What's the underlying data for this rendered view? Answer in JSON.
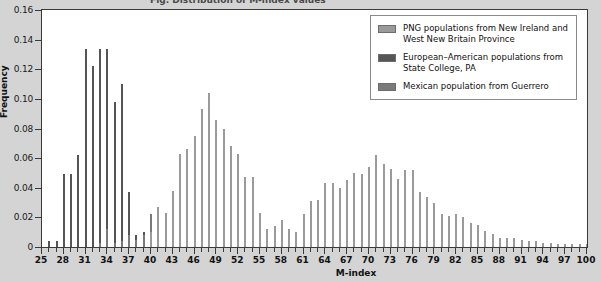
{
  "figure": {
    "cropped_title": "Fig. Distribution of M-index values"
  },
  "axes": {
    "y_title": "Frequency",
    "x_title": "M-index",
    "y_ticks": [
      "0",
      "0.02",
      "0.04",
      "0.06",
      "0.08",
      "0.10",
      "0.12",
      "0.14",
      "0.16"
    ],
    "x_ticks": [
      "25",
      "28",
      "31",
      "34",
      "37",
      "40",
      "43",
      "46",
      "49",
      "52",
      "55",
      "58",
      "61",
      "64",
      "67",
      "70",
      "73",
      "76",
      "79",
      "82",
      "85",
      "88",
      "91",
      "94",
      "97",
      "100"
    ]
  },
  "legend": {
    "items": [
      {
        "label": "PNG populations from New Ireland and West New Britain Province",
        "color": "#9a9a9a",
        "key": "png"
      },
      {
        "label": "European–American populations from State College, PA",
        "color": "#555555",
        "key": "eur"
      },
      {
        "label": "Mexican population from Guerrero",
        "color": "#7a7a7a",
        "key": "mex"
      }
    ]
  },
  "chart_data": {
    "type": "bar",
    "title": "",
    "xlabel": "M-index",
    "ylabel": "Frequency",
    "xlim": [
      25,
      100
    ],
    "ylim": [
      0,
      0.16
    ],
    "grid": false,
    "legend_position": "top-right",
    "x": [
      25,
      26,
      27,
      28,
      29,
      30,
      31,
      32,
      33,
      34,
      35,
      36,
      37,
      38,
      39,
      40,
      41,
      42,
      43,
      44,
      45,
      46,
      47,
      48,
      49,
      50,
      51,
      52,
      53,
      54,
      55,
      56,
      57,
      58,
      59,
      60,
      61,
      62,
      63,
      64,
      65,
      66,
      67,
      68,
      69,
      70,
      71,
      72,
      73,
      74,
      75,
      76,
      77,
      78,
      79,
      80,
      81,
      82,
      83,
      84,
      85,
      86,
      87,
      88,
      89,
      90,
      91,
      92,
      93,
      94,
      95,
      96,
      97,
      98,
      99,
      100
    ],
    "series": [
      {
        "name": "European–American populations from State College, PA",
        "color": "#555555",
        "values": [
          0,
          0.004,
          0.004,
          0.049,
          0.049,
          0.062,
          0.134,
          0.122,
          0.134,
          0.134,
          0.098,
          0.11,
          0.037,
          0.008,
          0.01,
          0.018,
          0.004,
          0.01,
          0.006,
          0.004,
          0.004,
          0.002,
          0.002,
          0.002,
          0.002,
          0.002,
          0.001,
          0.001,
          0.001,
          0.001,
          0.001,
          0,
          0,
          0,
          0,
          0,
          0,
          0,
          0,
          0,
          0,
          0,
          0,
          0,
          0,
          0,
          0,
          0,
          0,
          0,
          0,
          0,
          0,
          0,
          0,
          0,
          0,
          0,
          0,
          0,
          0,
          0,
          0,
          0,
          0,
          0,
          0,
          0,
          0,
          0,
          0,
          0,
          0,
          0,
          0,
          0
        ]
      },
      {
        "name": "Mexican population from Guerrero",
        "color": "#7a7a7a",
        "values": [
          0,
          0,
          0,
          0,
          0,
          0,
          0,
          0,
          0.003,
          0.012,
          0.003,
          0.004,
          0.008,
          0.005,
          0.008,
          0.022,
          0.006,
          0.008,
          0.025,
          0.006,
          0.006,
          0.006,
          0.005,
          0.006,
          0.006,
          0.006,
          0.005,
          0.005,
          0.005,
          0.004,
          0.004,
          0.004,
          0.004,
          0.004,
          0.004,
          0.004,
          0.004,
          0.004,
          0.004,
          0.004,
          0.004,
          0.004,
          0.004,
          0.004,
          0.004,
          0.004,
          0.004,
          0.004,
          0.004,
          0.003,
          0.003,
          0.003,
          0.003,
          0.003,
          0.003,
          0.003,
          0.003,
          0.003,
          0.002,
          0.002,
          0.002,
          0.002,
          0.002,
          0.002,
          0.002,
          0.002,
          0.002,
          0.002,
          0.002,
          0.001,
          0.001,
          0.001,
          0.001,
          0.001,
          0.001,
          0.001
        ]
      },
      {
        "name": "PNG populations from New Ireland and West New Britain Province",
        "color": "#9a9a9a",
        "values": [
          0,
          0,
          0,
          0,
          0,
          0,
          0,
          0,
          0,
          0,
          0,
          0,
          0,
          0,
          0,
          0.01,
          0.027,
          0.023,
          0.038,
          0.063,
          0.066,
          0.075,
          0.093,
          0.104,
          0.086,
          0.08,
          0.068,
          0.063,
          0.047,
          0.047,
          0.023,
          0.012,
          0.014,
          0.018,
          0.012,
          0.01,
          0.022,
          0.031,
          0.032,
          0.043,
          0.043,
          0.04,
          0.045,
          0.05,
          0.049,
          0.054,
          0.062,
          0.056,
          0.053,
          0.046,
          0.052,
          0.052,
          0.037,
          0.034,
          0.03,
          0.022,
          0.021,
          0.022,
          0.02,
          0.016,
          0.015,
          0.011,
          0.009,
          0.006,
          0.006,
          0.006,
          0.005,
          0.004,
          0.004,
          0.003,
          0.003,
          0.002,
          0.002,
          0.002,
          0.002,
          0.002
        ]
      }
    ]
  }
}
